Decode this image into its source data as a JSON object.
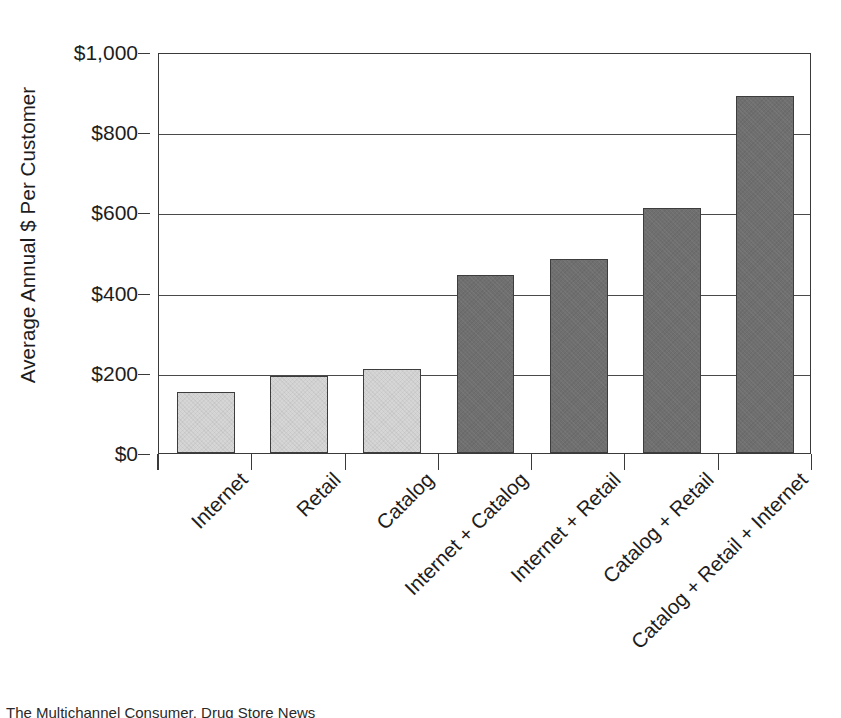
{
  "chart_data": {
    "type": "bar",
    "title": "",
    "xlabel": "",
    "ylabel": "Average Annual $ Per Customer",
    "ylim": [
      0,
      1000
    ],
    "grid": true,
    "legend": "none",
    "y_tick_values": [
      0,
      200,
      400,
      600,
      800,
      1000
    ],
    "y_tick_labels": [
      "$0",
      "$200",
      "$400",
      "$600",
      "$800",
      "$1,000"
    ],
    "categories": [
      "Internet",
      "Retail",
      "Catalog",
      "Internet + Catalog",
      "Internet + Retail",
      "Catalog + Retail",
      "Catalog + Retail + Internet"
    ],
    "values": [
      153,
      193,
      210,
      445,
      483,
      610,
      890
    ],
    "bar_shades": [
      "light",
      "light",
      "light",
      "dark",
      "dark",
      "dark",
      "dark"
    ],
    "colors": {
      "light_bar": "#d6d6d6",
      "dark_bar": "#6f6f6f",
      "bar_outline": "#3d3d3d",
      "axis": "#3a3a3a",
      "gridline": "#4a4a4a",
      "text": "#1d1d1d",
      "background": "#ffffff"
    }
  },
  "caption": {
    "text": "The Multichannel Consumer, Drug Store News"
  }
}
